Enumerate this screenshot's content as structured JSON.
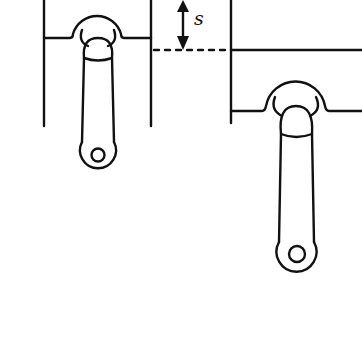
{
  "diagram": {
    "labels": {
      "stroke": "s"
    },
    "elements": [
      {
        "id": "piston-left",
        "description": "piston at top position with connecting rod"
      },
      {
        "id": "piston-right",
        "description": "piston displaced downward by stroke s with connecting rod"
      },
      {
        "id": "stroke-arrow",
        "description": "double-headed vertical arrow indicating stroke distance"
      },
      {
        "id": "reference-line",
        "description": "dashed horizontal reference line between pistons"
      }
    ],
    "colors": {
      "line": "#111111",
      "background": "#ffffff"
    }
  }
}
